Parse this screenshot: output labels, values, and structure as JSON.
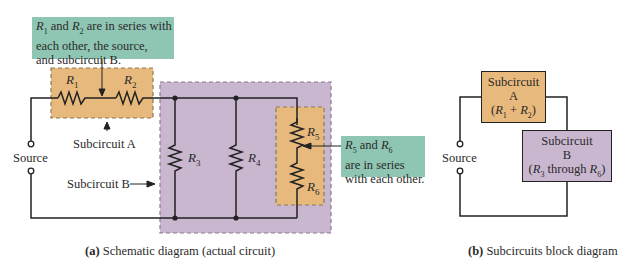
{
  "figure": {
    "colors": {
      "subcircuit_a": "#e8b97c",
      "subcircuit_b": "#c9b7d0",
      "callout": "#8fc5b3",
      "wire": "#222222"
    },
    "schematic": {
      "callout_top": {
        "lines": [
          "R1 and R2 are in series with",
          "each other, the source,",
          "and subcircuit B."
        ],
        "line1_prefix_r1": "R",
        "line1_sub1": "1",
        "line1_mid": " and ",
        "line1_r2": "R",
        "line1_sub2": "2",
        "line1_rest": " are in series with",
        "line2": "each other, the source,",
        "line3": "and subcircuit B."
      },
      "callout_right": {
        "r5": "R",
        "sub5": "5",
        "mid": " and ",
        "r6": "R",
        "sub6": "6",
        "line2": "are in series",
        "line3": "with each other."
      },
      "resistors": [
        {
          "name": "R",
          "sub": "1"
        },
        {
          "name": "R",
          "sub": "2"
        },
        {
          "name": "R",
          "sub": "3"
        },
        {
          "name": "R",
          "sub": "4"
        },
        {
          "name": "R",
          "sub": "5"
        },
        {
          "name": "R",
          "sub": "6"
        }
      ],
      "source_label": "Source",
      "subcircuit_a_label": "Subcircuit A",
      "subcircuit_b_label": "Subcircuit B",
      "caption_letter": "(a)",
      "caption_text": " Schematic diagram (actual circuit)"
    },
    "block_diagram": {
      "block_a": {
        "line1": "Subcircuit",
        "line2": "A",
        "line3": "(R1 + R2)"
      },
      "block_b": {
        "line1": "Subcircuit",
        "line2": "B",
        "line3": "(R3 through R6)"
      },
      "source_label": "Source",
      "caption_letter": "(b)",
      "caption_text": " Subcircuits block diagram"
    }
  }
}
